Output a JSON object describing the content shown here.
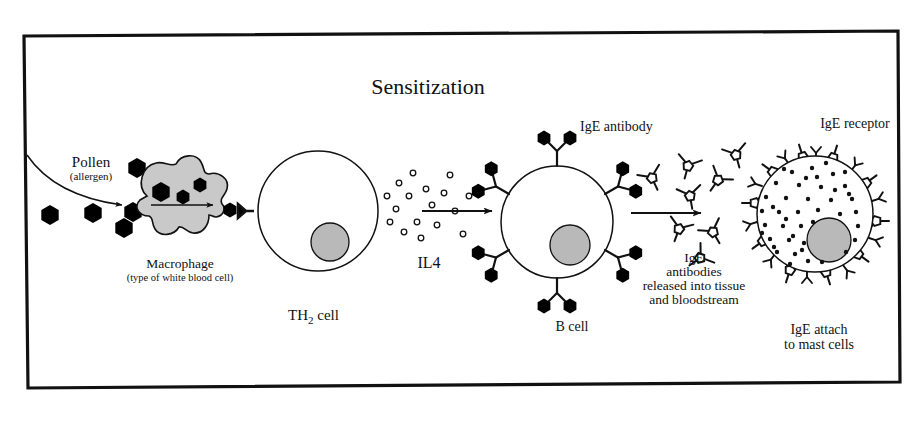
{
  "figure": {
    "title": "Sensitization",
    "domain": "immunology-allergy-diagram",
    "border_color": "#000000",
    "background_color": "#ffffff"
  },
  "labels": {
    "pollen": "Pollen",
    "pollen_sub": "(allergen)",
    "macrophage": "Macrophage",
    "macrophage_sub": "(type of white blood cell)",
    "th2_cell_pre": "TH",
    "th2_cell_sub": "2",
    "th2_cell_post": " cell",
    "il4": "IL4",
    "ige_antibody": "IgE antibody",
    "b_cell": "B cell",
    "released_line1": "IgE",
    "released_line2": "antibodies",
    "released_line3": "released into tissue",
    "released_line4": "and bloodstream",
    "ige_receptor": "IgE receptor",
    "mast_line1": "IgE attach",
    "mast_line2": "to mast cells"
  },
  "colors": {
    "outline": "#111111",
    "antigen_fill": "#000000",
    "cytoplasm_fill": "#c9c9c9",
    "nucleus_fill": "#b9b9b9",
    "white": "#ffffff"
  },
  "stages": [
    {
      "id": "pollen",
      "name": "Pollen (allergen) particles"
    },
    {
      "id": "macrophage",
      "name": "Macrophage engulfs allergen"
    },
    {
      "id": "th2",
      "name": "TH2 cell activated"
    },
    {
      "id": "il4",
      "name": "IL4 signalling to B cell"
    },
    {
      "id": "bcell",
      "name": "B cell produces IgE antibody"
    },
    {
      "id": "release",
      "name": "IgE released into tissue and bloodstream"
    },
    {
      "id": "mastcell",
      "name": "IgE attaches to mast cell receptors"
    }
  ],
  "elements": {
    "free_pollen_hexagons": 5,
    "macrophage_internal_hexagons": 3,
    "bcell_surface_antibodies": 6,
    "antigens_per_antibody": 2,
    "free_ige_antibodies": 8,
    "mastcell_bound_antibodies": 10,
    "mastcell_receptor_stubs": 10,
    "mastcell_granules": 46,
    "il4_particles": 17
  }
}
